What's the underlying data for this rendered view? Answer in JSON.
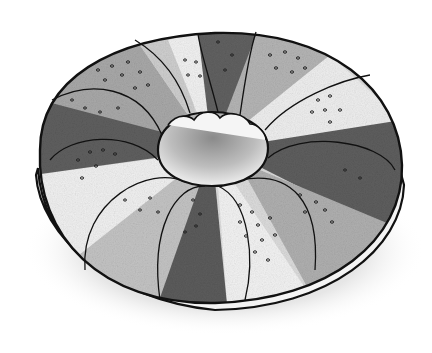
{
  "image": {
    "subject": "ring-shaped braided bread with alternating dark and light lobes and seed dots",
    "style": "pencil sketch, black outline, graphite shading",
    "width": 432,
    "height": 353,
    "background": "#ffffff",
    "outline_color": "#111111",
    "dark_lobe_color": "#5a5a5a",
    "mid_lobe_color": "#9a9a9a",
    "light_lobe_color": "#e4e4e4",
    "shadow_color": "#cfcfcf",
    "lobe_count": 12
  }
}
